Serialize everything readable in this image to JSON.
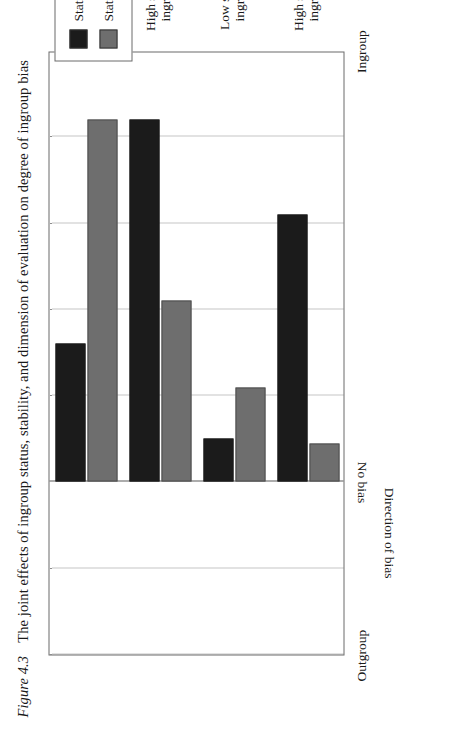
{
  "figure": {
    "number_label": "Figure 4.3",
    "caption": "The joint effects of ingroup status, stability, and dimension of evaluation on degree of ingroup bias"
  },
  "legend": {
    "entries": [
      {
        "label": "Status-relevant",
        "color": "#1b1b1b"
      },
      {
        "label": "Status-irrelevant",
        "color": "#6e6e6e"
      }
    ]
  },
  "axes": {
    "y_title": "Direction of bias",
    "y_ticks": [
      {
        "label": "Ingroup"
      },
      {
        "label": "No bias"
      },
      {
        "label": "Outgroup"
      }
    ],
    "x_groups": [
      {
        "line1": "High status",
        "line2": "ingroup"
      },
      {
        "line1": "Low status",
        "line2": "ingroup"
      },
      {
        "line1": "High status",
        "line2": "ingroup"
      },
      {
        "line1": "Low status",
        "line2": "ingroup"
      }
    ],
    "x_panels": [
      {
        "label": "Stable status differentials"
      },
      {
        "label": "Unstable status differentials"
      }
    ]
  },
  "chart_data": {
    "type": "bar",
    "title": "The joint effects of ingroup status, stability, and dimension of evaluation on degree of ingroup bias",
    "xlabel": "",
    "ylabel": "Direction of bias",
    "orientation": "vertical-bars-rotated",
    "grid": true,
    "legend_position": "top-right",
    "ylim": [
      -2,
      5
    ],
    "ytick_values": [
      5,
      0,
      -2
    ],
    "ytick_labels": [
      "Ingroup",
      "No bias",
      "Outgroup"
    ],
    "gridline_values": [
      4,
      3,
      2,
      1,
      -1,
      -2
    ],
    "categories": [
      "Stable / High status ingroup",
      "Stable / Low status ingroup",
      "Unstable / High status ingroup",
      "Unstable / Low status ingroup"
    ],
    "series": [
      {
        "name": "Status-relevant",
        "color": "#1b1b1b",
        "values": [
          3.1,
          0.5,
          4.2,
          1.6
        ]
      },
      {
        "name": "Status-irrelevant",
        "color": "#6e6e6e",
        "values": [
          0.45,
          1.1,
          2.1,
          4.2
        ]
      }
    ]
  }
}
